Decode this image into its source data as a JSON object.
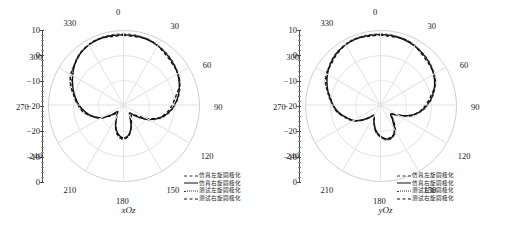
{
  "figure": {
    "top_strip_text": "",
    "background": "#ffffff"
  },
  "chart_data": [
    {
      "type": "line",
      "plot_kind": "polar-radiation-pattern",
      "title": "xOz",
      "xlabel": "角度 (°)",
      "ylabel": "增益 (dB)",
      "grid": true,
      "angle_unit": "degree",
      "angle_ticks": [
        0,
        30,
        60,
        90,
        120,
        150,
        180,
        210,
        240,
        270,
        300,
        330
      ],
      "angle_tick_labels": [
        "0",
        "30",
        "60",
        "90",
        "120",
        "150",
        "180",
        "210",
        "240",
        "270",
        "300",
        "330"
      ],
      "radial_ticks": [
        10,
        0,
        -10,
        -20,
        -20,
        -10,
        0
      ],
      "radial_tick_labels": [
        "10",
        "0",
        "−10",
        "−20",
        "−20",
        "−10",
        "0"
      ],
      "rlim": [
        -30,
        10
      ],
      "legend_position": "bottom-right",
      "series": [
        {
          "name": "仿真左旋圆极化",
          "style": "dash-dash",
          "color": "#333333",
          "angles": [
            0,
            10,
            20,
            30,
            40,
            50,
            60,
            70,
            80,
            90,
            100,
            110,
            120,
            130,
            140,
            150,
            160,
            170,
            180,
            190,
            200,
            210,
            220,
            230,
            240,
            250,
            260,
            270,
            280,
            290,
            300,
            310,
            320,
            330,
            340,
            350
          ],
          "values": [
            8,
            8,
            7.6,
            7,
            6.2,
            5.2,
            4,
            2.4,
            0.4,
            -2,
            -5,
            -9,
            -14,
            -20,
            -24,
            -22,
            -17,
            -13,
            -12,
            -14,
            -18,
            -23,
            -25,
            -21,
            -16,
            -12,
            -9,
            -6,
            -3.5,
            -1,
            1.5,
            4,
            6,
            7.2,
            7.8,
            8
          ]
        },
        {
          "name": "仿真右旋圆极化",
          "style": "solid",
          "color": "#111111",
          "angles": [
            0,
            10,
            20,
            30,
            40,
            50,
            60,
            70,
            80,
            90,
            100,
            110,
            120,
            130,
            140,
            150,
            160,
            170,
            180,
            190,
            200,
            210,
            220,
            230,
            240,
            250,
            260,
            270,
            280,
            290,
            300,
            310,
            320,
            330,
            340,
            350
          ],
          "values": [
            7.5,
            7.5,
            7.2,
            6.6,
            5.8,
            4.8,
            3.6,
            2,
            0,
            -2.5,
            -5.5,
            -9.5,
            -14.5,
            -20.5,
            -24.5,
            -22.5,
            -17.5,
            -13.5,
            -12.5,
            -14.5,
            -18.5,
            -23.5,
            -25.5,
            -21.5,
            -16.5,
            -12.5,
            -9.5,
            -6.5,
            -4,
            -1.5,
            1,
            3.6,
            5.6,
            6.8,
            7.4,
            7.5
          ]
        },
        {
          "name": "测试左旋圆极化",
          "style": "dotted",
          "color": "#333333",
          "angles": [
            0,
            10,
            20,
            30,
            40,
            50,
            60,
            70,
            80,
            90,
            100,
            110,
            120,
            130,
            140,
            150,
            160,
            170,
            180,
            190,
            200,
            210,
            220,
            230,
            240,
            250,
            260,
            270,
            280,
            290,
            300,
            310,
            320,
            330,
            340,
            350
          ],
          "values": [
            7.8,
            7.6,
            7.3,
            6.8,
            6.0,
            4.9,
            3.5,
            1.8,
            -0.4,
            -3,
            -6,
            -10,
            -15,
            -21,
            -23,
            -21,
            -16,
            -12.5,
            -11.5,
            -13.5,
            -17.5,
            -22.5,
            -24,
            -20.5,
            -15.5,
            -11.5,
            -8.5,
            -5.5,
            -3,
            -0.8,
            1.8,
            4.2,
            6.1,
            7.1,
            7.6,
            7.8
          ]
        },
        {
          "name": "测试右旋圆极化",
          "style": "thick-dash",
          "color": "#111111",
          "angles": [
            0,
            10,
            20,
            30,
            40,
            50,
            60,
            70,
            80,
            90,
            100,
            110,
            120,
            130,
            140,
            150,
            160,
            170,
            180,
            190,
            200,
            210,
            220,
            230,
            240,
            250,
            260,
            270,
            280,
            290,
            300,
            310,
            320,
            330,
            340,
            350
          ],
          "values": [
            7.2,
            7.2,
            6.9,
            6.3,
            5.5,
            4.4,
            3.2,
            1.5,
            -0.8,
            -3.4,
            -6.5,
            -10.5,
            -15.5,
            -21.5,
            -23.5,
            -21.5,
            -16.5,
            -13,
            -12,
            -14,
            -18,
            -23,
            -24.5,
            -21,
            -16,
            -12,
            -9,
            -6,
            -3.4,
            -1.2,
            1.4,
            3.9,
            5.8,
            6.9,
            7.2,
            7.2
          ]
        }
      ]
    },
    {
      "type": "line",
      "plot_kind": "polar-radiation-pattern",
      "title": "yOz",
      "xlabel": "角度 (°)",
      "ylabel": "增益 (dB)",
      "grid": true,
      "angle_unit": "degree",
      "angle_ticks": [
        0,
        30,
        60,
        90,
        120,
        150,
        180,
        210,
        240,
        270,
        300,
        330
      ],
      "angle_tick_labels": [
        "0",
        "30",
        "60",
        "90",
        "120",
        "150",
        "180",
        "210",
        "240",
        "270",
        "300",
        "330"
      ],
      "radial_ticks": [
        10,
        0,
        -10,
        -20,
        -20,
        -10,
        0
      ],
      "radial_tick_labels": [
        "10",
        "0",
        "−10",
        "−20",
        "−20",
        "−10",
        "0"
      ],
      "rlim": [
        -30,
        10
      ],
      "legend_position": "bottom-right",
      "series": [
        {
          "name": "仿真左旋圆极化",
          "style": "dash-dash",
          "color": "#333333",
          "angles": [
            0,
            10,
            20,
            30,
            40,
            50,
            60,
            70,
            80,
            90,
            100,
            110,
            120,
            130,
            140,
            150,
            160,
            170,
            180,
            190,
            200,
            210,
            220,
            230,
            240,
            250,
            260,
            270,
            280,
            290,
            300,
            310,
            320,
            330,
            340,
            350
          ],
          "values": [
            8,
            7.9,
            7.5,
            6.9,
            6.0,
            4.9,
            3.4,
            1.4,
            -1.2,
            -4.2,
            -8,
            -13,
            -19,
            -22,
            -19,
            -14,
            -11,
            -11,
            -13,
            -16,
            -20,
            -23,
            -21,
            -17,
            -13,
            -10,
            -7,
            -4.5,
            -2,
            0.5,
            2.8,
            4.8,
            6.4,
            7.4,
            7.9,
            8
          ]
        },
        {
          "name": "仿真右旋圆极化",
          "style": "solid",
          "color": "#111111",
          "angles": [
            0,
            10,
            20,
            30,
            40,
            50,
            60,
            70,
            80,
            90,
            100,
            110,
            120,
            130,
            140,
            150,
            160,
            170,
            180,
            190,
            200,
            210,
            220,
            230,
            240,
            250,
            260,
            270,
            280,
            290,
            300,
            310,
            320,
            330,
            340,
            350
          ],
          "values": [
            7.6,
            7.5,
            7.1,
            6.5,
            5.6,
            4.5,
            3.0,
            1.0,
            -1.6,
            -4.8,
            -8.6,
            -13.6,
            -19.6,
            -22.6,
            -19.6,
            -14.6,
            -11.6,
            -11.6,
            -13.6,
            -16.6,
            -20.6,
            -23.6,
            -21.6,
            -17.6,
            -13.6,
            -10.6,
            -7.6,
            -5,
            -2.5,
            0,
            2.4,
            4.4,
            6.0,
            7.0,
            7.5,
            7.6
          ]
        },
        {
          "name": "测试左旋圆极化",
          "style": "dotted",
          "color": "#333333",
          "angles": [
            0,
            10,
            20,
            30,
            40,
            50,
            60,
            70,
            80,
            90,
            100,
            110,
            120,
            130,
            140,
            150,
            160,
            170,
            180,
            190,
            200,
            210,
            220,
            230,
            240,
            250,
            260,
            270,
            280,
            290,
            300,
            310,
            320,
            330,
            340,
            350
          ],
          "values": [
            7.8,
            7.7,
            7.3,
            6.7,
            5.8,
            4.6,
            3.1,
            1.1,
            -1.5,
            -4.5,
            -8.3,
            -12.6,
            -18,
            -21,
            -18.5,
            -13.5,
            -10.5,
            -10.8,
            -12.8,
            -15.8,
            -19.8,
            -22.8,
            -21,
            -17,
            -13,
            -10,
            -7.2,
            -4.8,
            -2.3,
            0.3,
            2.6,
            4.6,
            6.2,
            7.2,
            7.7,
            7.8
          ]
        },
        {
          "name": "测试右旋圆极化",
          "style": "thick-dash",
          "color": "#111111",
          "angles": [
            0,
            10,
            20,
            30,
            40,
            50,
            60,
            70,
            80,
            90,
            100,
            110,
            120,
            130,
            140,
            150,
            160,
            170,
            180,
            190,
            200,
            210,
            220,
            230,
            240,
            250,
            260,
            270,
            280,
            290,
            300,
            310,
            320,
            330,
            340,
            350
          ],
          "values": [
            7.3,
            7.2,
            6.8,
            6.2,
            5.3,
            4.1,
            2.6,
            0.6,
            -2,
            -5.2,
            -9,
            -13.8,
            -19,
            -22,
            -19,
            -14,
            -11.2,
            -11.4,
            -13.4,
            -16.4,
            -20.4,
            -23.4,
            -21.4,
            -17.4,
            -13.4,
            -10.4,
            -7.4,
            -5,
            -2.6,
            -0.2,
            2.2,
            4.2,
            5.8,
            6.8,
            7.2,
            7.3
          ]
        }
      ]
    }
  ],
  "panels": [
    {
      "caption": "xOz",
      "angle_labels": [
        "0",
        "30",
        "60",
        "90",
        "120",
        "150",
        "180",
        "210",
        "240",
        "270",
        "300",
        "330"
      ],
      "radial_labels": [
        "10",
        "0",
        "−10",
        "−20",
        "−20",
        "−10",
        "0"
      ],
      "legend": [
        {
          "label": "仿真左旋圆极化",
          "style": "dash-dash"
        },
        {
          "label": "仿真右旋圆极化",
          "style": "solid"
        },
        {
          "label": "测试左旋圆极化",
          "style": "dotted"
        },
        {
          "label": "测试右旋圆极化",
          "style": "thick-dash"
        }
      ]
    },
    {
      "caption": "yOz",
      "angle_labels": [
        "0",
        "30",
        "60",
        "90",
        "120",
        "150",
        "180",
        "210",
        "240",
        "270",
        "300",
        "330"
      ],
      "radial_labels": [
        "10",
        "0",
        "−10",
        "−20",
        "−20",
        "−10",
        "0"
      ],
      "legend": [
        {
          "label": "仿真左旋圆极化",
          "style": "dash-dash"
        },
        {
          "label": "仿真右旋圆极化",
          "style": "solid"
        },
        {
          "label": "测试左旋圆极化",
          "style": "dotted"
        },
        {
          "label": "测试右旋圆极化",
          "style": "thick-dash"
        }
      ]
    }
  ]
}
